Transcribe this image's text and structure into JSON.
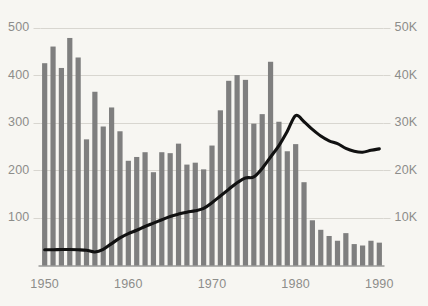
{
  "chart_data": {
    "type": "bar",
    "title": "",
    "subtitle": "",
    "xlabel": "",
    "ylabel": "",
    "grid": true,
    "legend": "none",
    "background_color": "#f7f6f2",
    "bar_color": "#7f7f7f",
    "line_color": "#111111",
    "axis_text_color": "#8d8d8a",
    "gridline_color": "#d8d6d0",
    "axis_line_color": "#6f6f6f",
    "x": [
      1950,
      1951,
      1952,
      1953,
      1954,
      1955,
      1956,
      1957,
      1958,
      1959,
      1960,
      1961,
      1962,
      1963,
      1964,
      1965,
      1966,
      1967,
      1968,
      1969,
      1970,
      1971,
      1972,
      1973,
      1974,
      1975,
      1976,
      1977,
      1978,
      1979,
      1980,
      1981,
      1982,
      1983,
      1984,
      1985,
      1986,
      1987,
      1988,
      1989,
      1990
    ],
    "xlim": [
      1949.5,
      1990.5
    ],
    "xticks": [
      1950,
      1960,
      1970,
      1980,
      1990
    ],
    "xticklabels": [
      "1950",
      "1960",
      "1970",
      "1980",
      "1990"
    ],
    "left_axis": {
      "ylim": [
        0,
        500
      ],
      "yticks": [
        100,
        200,
        300,
        400,
        500
      ],
      "yticklabels": [
        "100",
        "200",
        "300",
        "400",
        "500"
      ]
    },
    "right_axis": {
      "ylim": [
        0,
        50000
      ],
      "yticks": [
        10000,
        20000,
        30000,
        40000,
        50000
      ],
      "yticklabels": [
        "10K",
        "20K",
        "30K",
        "40K",
        "50K"
      ]
    },
    "series": [
      {
        "name": "bars",
        "render": "bar",
        "axis": "left",
        "color": "#7f7f7f",
        "values": [
          425,
          460,
          415,
          478,
          437,
          265,
          365,
          292,
          332,
          282,
          220,
          228,
          238,
          196,
          238,
          236,
          256,
          212,
          216,
          202,
          252,
          326,
          388,
          400,
          390,
          298,
          318,
          428,
          302,
          240,
          255,
          175,
          95,
          75,
          62,
          52,
          68,
          45,
          42,
          52,
          48
        ]
      },
      {
        "name": "line",
        "render": "line",
        "axis": "right",
        "color": "#111111",
        "values": [
          3300,
          3300,
          3350,
          3350,
          3300,
          3200,
          2850,
          3400,
          4600,
          5800,
          6700,
          7400,
          8200,
          8900,
          9600,
          10300,
          10800,
          11200,
          11500,
          12000,
          13200,
          14600,
          16000,
          17400,
          18400,
          18600,
          20400,
          22800,
          25200,
          28200,
          31500,
          30200,
          28600,
          27200,
          26200,
          25600,
          24600,
          24000,
          23800,
          24200,
          24500
        ]
      }
    ]
  }
}
